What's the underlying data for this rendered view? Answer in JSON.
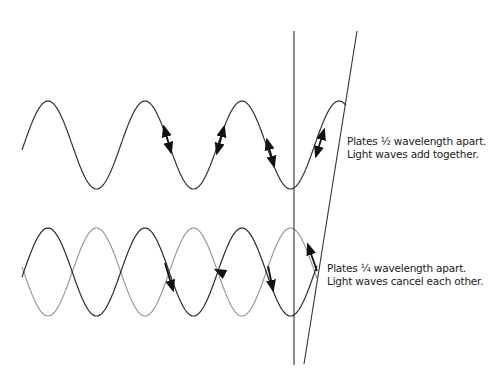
{
  "figure": {
    "top_diagram": {
      "caption_line1": "Plates ½ wavelength apart.",
      "caption_line2": "Light waves add together.",
      "wave": {
        "x_start": 22,
        "x_end": 346,
        "midline_y": 145,
        "amplitude": 44,
        "wavelength": 97,
        "first_peak_x": 48,
        "color": "#333333"
      },
      "arrows": [
        {
          "x1": 164,
          "y1": 127,
          "x2": 171,
          "y2": 152,
          "heads": "both"
        },
        {
          "x1": 224,
          "y1": 127,
          "x2": 217,
          "y2": 153,
          "heads": "both"
        },
        {
          "x1": 267,
          "y1": 140,
          "x2": 274,
          "y2": 166,
          "heads": "both"
        },
        {
          "x1": 324,
          "y1": 130,
          "x2": 316,
          "y2": 156,
          "heads": "both"
        }
      ]
    },
    "bottom_diagram": {
      "caption_line1": "Plates ¼ wavelength apart.",
      "caption_line2": "Light waves cancel each other.",
      "wave_dark": {
        "x_start": 22,
        "x_end": 317,
        "midline_y": 272,
        "amplitude": 44,
        "wavelength": 97,
        "first_peak_x": 48,
        "color": "#2a2a2a"
      },
      "wave_light": {
        "x_start": 22,
        "x_end": 317,
        "midline_y": 272,
        "amplitude": 44,
        "wavelength": 97,
        "first_peak_x": 96.5,
        "color": "#9a9a9a"
      },
      "arrows": [
        {
          "x1": 165,
          "y1": 263,
          "x2": 173,
          "y2": 290,
          "heads": "end"
        },
        {
          "x1": 218,
          "y1": 271,
          "x2": 216,
          "y2": 270,
          "heads": "end"
        },
        {
          "x1": 268,
          "y1": 266,
          "x2": 273,
          "y2": 290,
          "heads": "end"
        },
        {
          "x1": 317,
          "y1": 271,
          "x2": 308,
          "y2": 245,
          "heads": "end"
        }
      ]
    },
    "plates": {
      "vertical": {
        "x1": 294,
        "y1": 31,
        "x2": 294,
        "y2": 365
      },
      "slanted": {
        "x1": 357,
        "y1": 31,
        "x2": 304,
        "y2": 364
      },
      "color": "#333333"
    }
  }
}
